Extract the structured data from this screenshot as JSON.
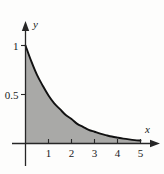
{
  "chart_data": {
    "type": "area",
    "title": "",
    "subtitle": "",
    "xlabel": "x",
    "ylabel": "y",
    "xlim": [
      0,
      5.4
    ],
    "ylim": [
      0,
      1.12
    ],
    "grid": false,
    "legend": null,
    "annotations": [],
    "x_ticks": [
      1,
      2,
      3,
      4,
      5
    ],
    "x_tick_labels": [
      "1",
      "2",
      "3",
      "4",
      "5"
    ],
    "y_ticks": [
      0.5,
      1
    ],
    "y_tick_labels": [
      "0.5",
      "1"
    ],
    "series": [
      {
        "name": "decaying-curve",
        "fill": true,
        "fill_color": "#a9a9a7",
        "line_color": "#111111",
        "x": [
          0,
          0.25,
          0.5,
          0.75,
          1,
          1.25,
          1.5,
          1.75,
          2,
          2.25,
          2.5,
          2.75,
          3,
          3.25,
          3.5,
          3.75,
          4,
          4.25,
          4.5,
          4.75,
          5
        ],
        "values": [
          1,
          0.84,
          0.7,
          0.59,
          0.49,
          0.41,
          0.35,
          0.29,
          0.25,
          0.2,
          0.17,
          0.14,
          0.12,
          0.1,
          0.085,
          0.071,
          0.06,
          0.05,
          0.042,
          0.035,
          0.03
        ]
      }
    ]
  },
  "figure": {
    "axis_color": "#262626",
    "background_color": "#fdfdfc",
    "x_axis_label": "x",
    "y_axis_label": "y"
  }
}
